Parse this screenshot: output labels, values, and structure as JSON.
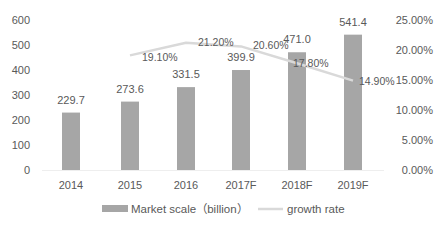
{
  "chart_data": {
    "type": "bar",
    "title": "",
    "categories": [
      "2014",
      "2015",
      "2016",
      "2017F",
      "2018F",
      "2019F"
    ],
    "series": [
      {
        "name": "Market scale（billion）",
        "type": "bar",
        "axis": "left",
        "values": [
          229.7,
          273.6,
          331.5,
          399.9,
          471.0,
          541.4
        ],
        "labels": [
          "229.7",
          "273.6",
          "331.5",
          "399.9",
          "471.0",
          "541.4"
        ],
        "color": "#a6a6a6"
      },
      {
        "name": "growth rate",
        "type": "line",
        "axis": "right",
        "values": [
          null,
          19.1,
          21.2,
          20.6,
          17.8,
          14.9
        ],
        "labels": [
          "",
          "19.10%",
          "21.20%",
          "20.60%",
          "17.80%",
          "14.90%"
        ],
        "color": "#d9d9d9"
      }
    ],
    "xlabel": "",
    "ylabel": "",
    "left_axis": {
      "ticks": [
        "0",
        "100",
        "200",
        "300",
        "400",
        "500",
        "600"
      ],
      "ylim": [
        0,
        600
      ]
    },
    "right_axis": {
      "ticks": [
        "0.00%",
        "5.00%",
        "10.00%",
        "15.00%",
        "20.00%",
        "25.00%"
      ],
      "ylim": [
        0,
        25
      ]
    },
    "grid": false,
    "legend_position": "bottom"
  },
  "legend": {
    "bar_label": "Market scale（billion）",
    "line_label": "growth rate"
  }
}
